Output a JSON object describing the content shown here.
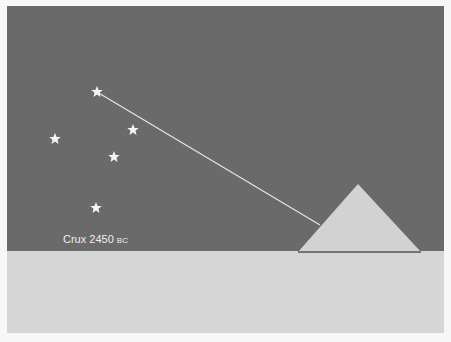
{
  "figure": {
    "label_main": "Crux 2450",
    "label_era": "BC",
    "colors": {
      "sky": "#6a6a6a",
      "ground": "#d6d6d6",
      "pyramid": "#d2d2d2",
      "pyramid_base": "#555555",
      "star": "#f4f4f4",
      "sightline": "#e6e6e6"
    },
    "stars": [
      {
        "name": "star-top",
        "x": 90,
        "y": 86
      },
      {
        "name": "star-right",
        "x": 126,
        "y": 124
      },
      {
        "name": "star-left",
        "x": 48,
        "y": 133
      },
      {
        "name": "star-center",
        "x": 107,
        "y": 151
      },
      {
        "name": "star-bottom",
        "x": 89,
        "y": 202
      }
    ],
    "sightline": {
      "x1": 90,
      "y1": 86,
      "x2": 313,
      "y2": 219
    },
    "pyramid": {
      "apex": [
        351,
        178
      ],
      "base_left": [
        291,
        246
      ],
      "base_right": [
        414,
        246
      ]
    },
    "horizon_y": 245
  }
}
